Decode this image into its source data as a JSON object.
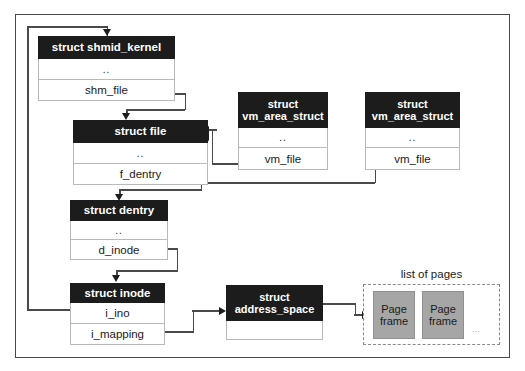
{
  "diagram": {
    "page_list": {
      "label": "list of pages",
      "frames": [
        {
          "line1": "Page",
          "line2": "frame"
        },
        {
          "line1": "Page",
          "line2": "frame"
        }
      ],
      "ellipsis": "..."
    },
    "boxes": [
      {
        "id": "shmid_kernel",
        "title": "struct shmid_kernel",
        "title_lines": [
          "struct shmid_kernel"
        ],
        "rows": [
          "..",
          "shm_file"
        ]
      },
      {
        "id": "file",
        "title": "struct file",
        "title_lines": [
          "struct file"
        ],
        "rows": [
          "..",
          "f_dentry"
        ]
      },
      {
        "id": "dentry",
        "title": "struct dentry",
        "title_lines": [
          "struct dentry"
        ],
        "rows": [
          "..",
          "d_inode"
        ]
      },
      {
        "id": "inode",
        "title": "struct inode",
        "title_lines": [
          "struct inode"
        ],
        "rows": [
          "i_ino",
          "i_mapping"
        ]
      },
      {
        "id": "vma_left",
        "title": "struct vm_area_struct",
        "title_lines": [
          "struct",
          "vm_area_struct"
        ],
        "rows": [
          "..",
          "vm_file"
        ]
      },
      {
        "id": "vma_right",
        "title": "struct vm_area_struct",
        "title_lines": [
          "struct",
          "vm_area_struct"
        ],
        "rows": [
          "..",
          "vm_file"
        ]
      },
      {
        "id": "address_space",
        "title": "struct address_space",
        "title_lines": [
          "struct",
          "address_space"
        ],
        "rows": [
          ""
        ]
      }
    ],
    "colors": {
      "header_bg": "#1c1c1c",
      "header_fg": "#ffffff",
      "row_bg": "#ffffff",
      "border": "#b9b9b9",
      "frame_border": "#4a4a4a",
      "connector": "#4a4a4a",
      "page_frame_fill": "#a6a6a6",
      "page_list_border": "#8a8a8a"
    }
  }
}
